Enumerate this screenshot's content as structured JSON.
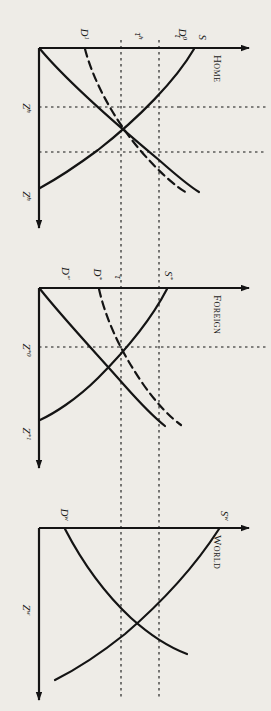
{
  "figure": {
    "orientation": "rotated-90-clockwise",
    "background_color": "#eeece7",
    "ink_color": "#141414",
    "panels": [
      {
        "id": "home",
        "title": "Home",
        "axis_label_vertical": "Z",
        "axis_label_vertical_sup": "h",
        "axis_label_horizontal": "Z",
        "axis_label_horizontal_sup": "h",
        "curves": [
          {
            "name": "supply",
            "label": "S",
            "sup": "",
            "style": "solid"
          },
          {
            "name": "demand-initial",
            "label": "D",
            "sup": "0",
            "style": "solid"
          },
          {
            "name": "demand-shifted",
            "label": "D",
            "sup": "1",
            "style": "dashed"
          }
        ],
        "tick_labels": [
          {
            "name": "tau-low",
            "label": "τ",
            "sup": ""
          },
          {
            "name": "tau-high",
            "label": "τ",
            "sup": "h"
          }
        ]
      },
      {
        "id": "foreign",
        "title": "Foreign",
        "axis_label_vertical": "Z",
        "axis_label_vertical_sup": "*1",
        "axis_label_horizontal": "Z",
        "axis_label_horizontal_sup": "*0",
        "curves": [
          {
            "name": "supply-foreign",
            "label": "S",
            "sup": "*",
            "style": "solid"
          },
          {
            "name": "demand-foreign-initial",
            "label": "D",
            "sup": "*",
            "style": "dashed"
          },
          {
            "name": "demand-foreign-shifted",
            "label": "D",
            "sup": "*′",
            "style": "solid"
          }
        ],
        "tick_labels": [
          {
            "name": "tau-foreign",
            "label": "τ",
            "sup": ""
          }
        ]
      },
      {
        "id": "world",
        "title": "World",
        "axis_label_vertical": "Z",
        "axis_label_vertical_sup": "w",
        "axis_label_horizontal": "",
        "axis_label_horizontal_sup": "",
        "curves": [
          {
            "name": "supply-world",
            "label": "S",
            "sup": "w",
            "style": "solid"
          },
          {
            "name": "demand-world",
            "label": "D",
            "sup": "w",
            "style": "solid"
          }
        ],
        "tick_labels": []
      }
    ],
    "guides": [
      {
        "name": "guide-line-left",
        "style": "dotted"
      },
      {
        "name": "guide-line-right",
        "style": "dotted"
      }
    ]
  }
}
